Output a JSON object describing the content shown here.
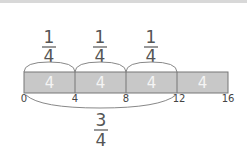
{
  "diagram": {
    "type": "tape-diagram",
    "bar": {
      "total": 16,
      "segments": [
        {
          "label": "4"
        },
        {
          "label": "4"
        },
        {
          "label": "4"
        },
        {
          "label": "4"
        }
      ],
      "fill": "#c8c8c8",
      "stroke": "#777777"
    },
    "ticks": [
      "0",
      "4",
      "8",
      "12",
      "16"
    ],
    "top_fractions": [
      {
        "num": "1",
        "den": "4"
      },
      {
        "num": "1",
        "den": "4"
      },
      {
        "num": "1",
        "den": "4"
      }
    ],
    "bottom_fraction": {
      "num": "3",
      "den": "4"
    }
  }
}
